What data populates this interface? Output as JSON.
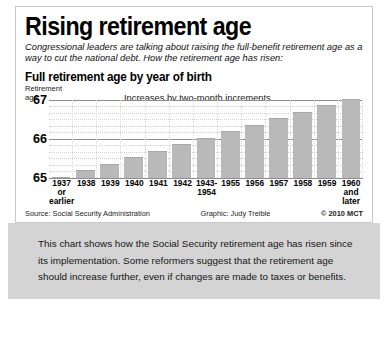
{
  "headline": "Rising retirement age",
  "deck": "Congressional leaders are talking about raising the full-benefit retirement age as a way to cut the national debt. How the retirement age has risen:",
  "subhead": "Full retirement age by year of birth",
  "axis_caption_line1": "Retirement",
  "axis_caption_line2": "age",
  "annotation": "Increases by two-month increments",
  "credits": {
    "source": "Source: Social Security Administration",
    "graphic": "Graphic: Judy Treible",
    "copyright": "© 2010 MCT"
  },
  "caption": "This chart shows how the Social Security retirement age has risen since its implementation. Some reformers suggest that the retirement age should increase further, even if changes are made to taxes or benefits.",
  "colors": {
    "bar": "#b9b9b9",
    "gridline": "#8e8e8e",
    "minor_gridline": "#d2d2d2",
    "caption_background": "#d4d4d4",
    "panel_border": "#c9c9c9"
  },
  "chart_data": {
    "type": "bar",
    "title": "Full retirement age by year of birth",
    "xlabel": "",
    "ylabel": "Retirement age",
    "ylim": [
      65,
      67
    ],
    "yticks": [
      65,
      66,
      67
    ],
    "ytick_labels": [
      "65",
      "66",
      "67"
    ],
    "grid": true,
    "minor_tick_step": 0.1667,
    "annotation": "Increases by two-month increments",
    "units": "years",
    "categories": [
      "1937 or earlier",
      "1938",
      "1939",
      "1940",
      "1941",
      "1942",
      "1943-1954",
      "1955",
      "1956",
      "1957",
      "1958",
      "1959",
      "1960 and later"
    ],
    "category_lines": [
      [
        "1937",
        "or",
        "earlier"
      ],
      [
        "1938"
      ],
      [
        "1939"
      ],
      [
        "1940"
      ],
      [
        "1941"
      ],
      [
        "1942"
      ],
      [
        "1943-",
        "1954"
      ],
      [
        "1955"
      ],
      [
        "1956"
      ],
      [
        "1957"
      ],
      [
        "1958"
      ],
      [
        "1959"
      ],
      [
        "1960",
        "and",
        "later"
      ]
    ],
    "values": [
      65.0,
      65.167,
      65.333,
      65.5,
      65.667,
      65.833,
      66.0,
      66.167,
      66.333,
      66.5,
      66.667,
      66.833,
      67.0
    ],
    "value_labels": [
      "65",
      "65 and 2 months",
      "65 and 4 months",
      "65 and 6 months",
      "65 and 8 months",
      "65 and 10 months",
      "66",
      "66 and 2 months",
      "66 and 4 months",
      "66 and 6 months",
      "66 and 8 months",
      "66 and 10 months",
      "67"
    ]
  }
}
